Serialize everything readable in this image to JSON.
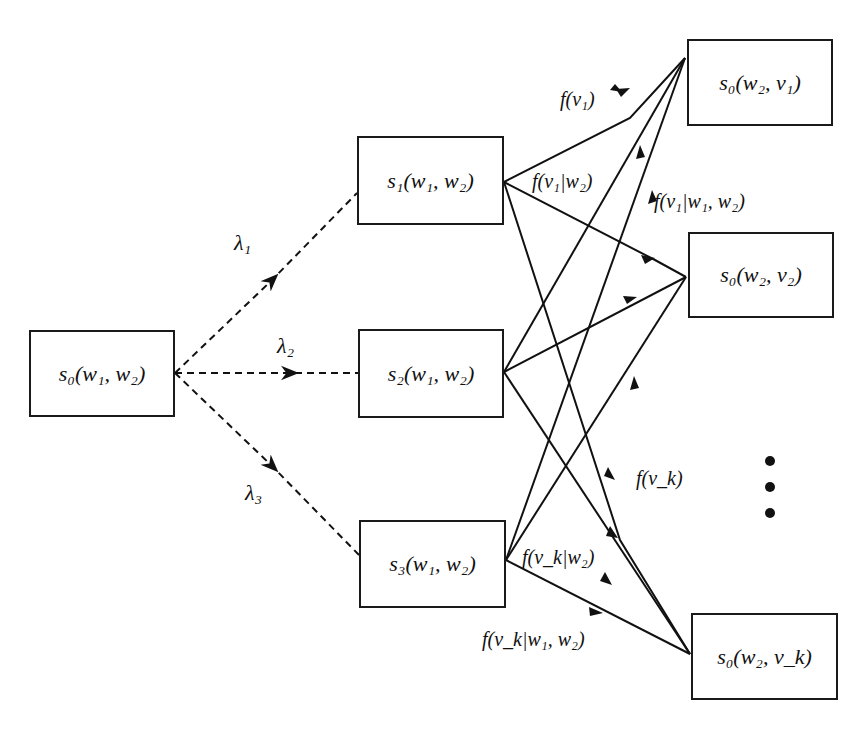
{
  "diagram": {
    "source_node": {
      "label": "s₀(w₁, w₂)"
    },
    "middle_nodes": [
      {
        "label": "s₁(w₁, w₂)"
      },
      {
        "label": "s₂(w₁, w₂)"
      },
      {
        "label": "s₃(w₁, w₂)"
      }
    ],
    "target_nodes": [
      {
        "label": "s₀(w₂, v₁)"
      },
      {
        "label": "s₀(w₂, v₂)"
      },
      {
        "label": "s₀(w₂, v_k)"
      }
    ],
    "lambda_labels": [
      "λ₁",
      "λ₂",
      "λ₃"
    ],
    "edge_labels": {
      "f_v1": "f(v₁)",
      "f_v1_w2": "f(v₁|w₂)",
      "f_v1_w1w2": "f(v₁|w₁, w₂)",
      "f_vk": "f(v_k)",
      "f_vk_w2": "f(v_k|w₂)",
      "f_vk_w1w2": "f(v_k|w₁, w₂)"
    },
    "ellipsis": "⋮"
  }
}
